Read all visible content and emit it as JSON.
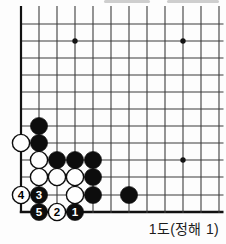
{
  "caption": {
    "text": "1도(정해 1)"
  },
  "board": {
    "background": "#fdfdfd",
    "line_color": "#3d3d3d",
    "edge_color": "#111111",
    "black_stone_color": "#0d0d0d",
    "white_stone_color": "#fefefe",
    "cols_x": [
      21,
      39,
      57,
      75,
      93,
      111,
      129,
      147,
      165,
      183,
      201,
      219
    ],
    "rows_y": [
      24,
      41,
      58,
      75,
      92,
      109,
      126,
      143,
      160,
      177,
      195,
      212
    ],
    "top_cut_y": 6,
    "right_cut_x": 223.5,
    "stone_radius": 8.6,
    "star_points": [
      {
        "col": 3,
        "row": 1
      },
      {
        "col": 9,
        "row": 1
      },
      {
        "col": 9,
        "row": 8
      }
    ],
    "stones": [
      {
        "col": 1,
        "row": 6,
        "color": "black"
      },
      {
        "col": 0,
        "row": 7,
        "color": "white"
      },
      {
        "col": 1,
        "row": 7,
        "color": "black"
      },
      {
        "col": 1,
        "row": 8,
        "color": "white"
      },
      {
        "col": 2,
        "row": 8,
        "color": "black"
      },
      {
        "col": 3,
        "row": 8,
        "color": "black"
      },
      {
        "col": 4,
        "row": 8,
        "color": "black"
      },
      {
        "col": 1,
        "row": 9,
        "color": "white"
      },
      {
        "col": 2,
        "row": 9,
        "color": "white"
      },
      {
        "col": 3,
        "row": 9,
        "color": "white"
      },
      {
        "col": 4,
        "row": 9,
        "color": "black"
      },
      {
        "col": 0,
        "row": 10,
        "color": "white",
        "label": "4"
      },
      {
        "col": 1,
        "row": 10,
        "color": "black",
        "label": "3"
      },
      {
        "col": 3,
        "row": 10,
        "color": "white"
      },
      {
        "col": 4,
        "row": 10,
        "color": "black"
      },
      {
        "col": 6,
        "row": 10,
        "color": "black"
      },
      {
        "col": 1,
        "row": 11,
        "color": "black",
        "label": "5"
      },
      {
        "col": 2,
        "row": 11,
        "color": "white",
        "label": "2"
      },
      {
        "col": 3,
        "row": 11,
        "color": "black",
        "label": "1"
      }
    ]
  }
}
